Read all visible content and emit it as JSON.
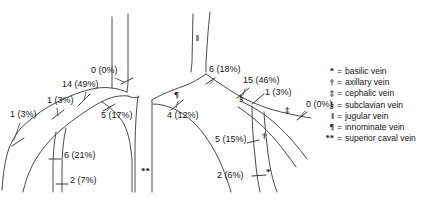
{
  "figure": {
    "line_color": "#4a4a4a",
    "text_color": "#141414",
    "background": "#ffffff"
  },
  "legend": {
    "entries": [
      {
        "symbol": "*",
        "equals": "=",
        "label": "basilic vein"
      },
      {
        "symbol": "†",
        "equals": "=",
        "label": "axillary vein"
      },
      {
        "symbol": "‡",
        "equals": "=",
        "label": "cephalic vein"
      },
      {
        "symbol": "§",
        "equals": "=",
        "label": "subclavian vein"
      },
      {
        "symbol": "‖",
        "equals": "=",
        "label": "jugular vein"
      },
      {
        "symbol": "¶",
        "equals": "=",
        "label": "innominate vein"
      },
      {
        "symbol": "**",
        "equals": "=",
        "label": "superior caval vein"
      }
    ]
  },
  "vessel_symbols": [
    {
      "id": "jugular-left",
      "symbol": "‖",
      "x": 196,
      "y": 38
    },
    {
      "id": "innominate-left",
      "symbol": "¶",
      "x": 174,
      "y": 95
    },
    {
      "id": "subclavian-right",
      "symbol": "§",
      "x": 239,
      "y": 98
    },
    {
      "id": "cephalic-right",
      "symbol": "‡",
      "x": 285,
      "y": 110
    },
    {
      "id": "axillary-right",
      "symbol": "†",
      "x": 262,
      "y": 136
    },
    {
      "id": "basilic-right",
      "symbol": "*",
      "x": 266,
      "y": 172
    },
    {
      "id": "superior-caval-vein",
      "symbol": "**",
      "x": 143,
      "y": 170
    }
  ],
  "measurements": [
    {
      "id": "left-outer-distal",
      "count": 1,
      "percent": "3%",
      "text": "1 (3%)",
      "x": 10,
      "y": 114
    },
    {
      "id": "left-mid-distal",
      "count": 1,
      "percent": "3%",
      "text": "1 (3%)",
      "x": 47,
      "y": 100
    },
    {
      "id": "left-subclavian",
      "count": 14,
      "percent": "49%",
      "text": "14 (49%)",
      "x": 62,
      "y": 84
    },
    {
      "id": "left-jugular",
      "count": 0,
      "percent": "0%",
      "text": "0 (0%)",
      "x": 91,
      "y": 70
    },
    {
      "id": "left-innominate",
      "count": 5,
      "percent": "17%",
      "text": "5 (17%)",
      "x": 101,
      "y": 115
    },
    {
      "id": "left-axillary",
      "count": 6,
      "percent": "21%",
      "text": "6 (21%)",
      "x": 64,
      "y": 155
    },
    {
      "id": "left-basilic",
      "count": 2,
      "percent": "7%",
      "text": "2 (7%)",
      "x": 68,
      "y": 180
    },
    {
      "id": "right-innominate",
      "count": 4,
      "percent": "12%",
      "text": "4 (12%)",
      "x": 167,
      "y": 115
    },
    {
      "id": "right-jugular",
      "count": 6,
      "percent": "18%",
      "text": "6 (18%)",
      "x": 210,
      "y": 70
    },
    {
      "id": "right-subclavian",
      "count": 15,
      "percent": "46%",
      "text": "15 (46%)",
      "x": 242,
      "y": 80
    },
    {
      "id": "right-sub-distal",
      "count": 1,
      "percent": "3%",
      "text": "1 (3%)",
      "x": 264,
      "y": 90
    },
    {
      "id": "right-cephalic",
      "count": 0,
      "percent": "0%",
      "text": "0 (0%)",
      "x": 303,
      "y": 104
    },
    {
      "id": "right-axillary",
      "count": 5,
      "percent": "15%",
      "text": "5 (15%)",
      "x": 219,
      "y": 139
    },
    {
      "id": "right-basilic",
      "count": 2,
      "percent": "6%",
      "text": "2 (6%)",
      "x": 221,
      "y": 172
    }
  ]
}
